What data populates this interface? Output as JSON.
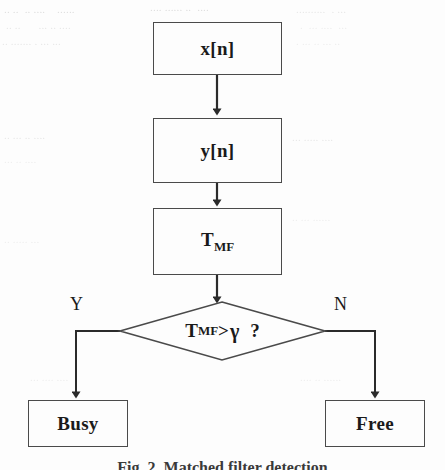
{
  "figure": {
    "caption": "Fig. 2.  Matched filter detection",
    "type": "flowchart"
  },
  "nodes": {
    "input": {
      "label": "x[n]",
      "shape": "rectangle"
    },
    "filtered": {
      "label": "y[n]",
      "shape": "rectangle"
    },
    "statistic": {
      "label_base": "T",
      "label_sub": "MF",
      "shape": "rectangle"
    },
    "decision": {
      "label_base": "T",
      "label_sub": "MF",
      "operator": ">",
      "threshold": "γ",
      "question": "?",
      "shape": "diamond"
    },
    "busy": {
      "label": "Busy",
      "shape": "rectangle"
    },
    "free": {
      "label": "Free",
      "shape": "rectangle"
    }
  },
  "branches": {
    "yes": "Y",
    "no": "N"
  },
  "colors": {
    "stroke": "#4a4a4a",
    "text": "#1a1a1a",
    "background": "#fdfdfd",
    "bleed_through": "#d9d9d9"
  },
  "background_text": {
    "note": "faint bleed-through from reverse side of the scanned page, illegible",
    "lines": [
      "· ··· ·· · ···· ·· ·····",
      "·· · ··· ···· ·· ···",
      "···· ·· ····· · ····"
    ]
  }
}
